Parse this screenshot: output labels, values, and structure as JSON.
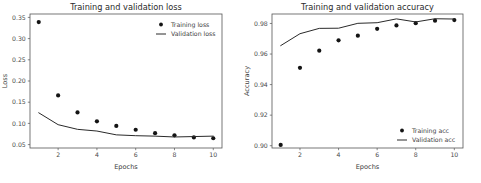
{
  "figure": {
    "background": "#ffffff",
    "accent": "#141414",
    "width": 481,
    "height": 183
  },
  "chart_data": [
    {
      "type": "scatter",
      "id": "loss-chart",
      "title": "Training and validation loss",
      "xlabel": "Epochs",
      "ylabel": "Loss",
      "x": [
        1,
        2,
        3,
        4,
        5,
        6,
        7,
        8,
        9,
        10
      ],
      "xlim": [
        0.55,
        10.45
      ],
      "ylim": [
        0.042,
        0.358
      ],
      "xticks": [
        2,
        4,
        6,
        8,
        10
      ],
      "xticklabels": [
        "2",
        "4",
        "6",
        "8",
        "10"
      ],
      "yticks": [
        0.05,
        0.1,
        0.15,
        0.2,
        0.25,
        0.3,
        0.35
      ],
      "yticklabels": [
        "0.05",
        "0.10",
        "0.15",
        "0.20",
        "0.25",
        "0.30",
        "0.35"
      ],
      "grid": false,
      "legend_position": "upper right",
      "series": [
        {
          "name": "Training loss",
          "style": "dot",
          "color": "#141414",
          "values": [
            0.339,
            0.166,
            0.126,
            0.105,
            0.094,
            0.085,
            0.077,
            0.072,
            0.067,
            0.065
          ]
        },
        {
          "name": "Validation loss",
          "style": "line",
          "color": "#2a2a2a",
          "values": [
            0.125,
            0.097,
            0.086,
            0.082,
            0.073,
            0.071,
            0.07,
            0.068,
            0.069,
            0.07
          ]
        }
      ]
    },
    {
      "type": "scatter",
      "id": "accuracy-chart",
      "title": "Training and validation accuracy",
      "xlabel": "Epochs",
      "ylabel": "Accuracy",
      "x": [
        1,
        2,
        3,
        4,
        5,
        6,
        7,
        8,
        9,
        10
      ],
      "xlim": [
        0.55,
        10.45
      ],
      "ylim": [
        0.8985,
        0.9862
      ],
      "xticks": [
        2,
        4,
        6,
        8,
        10
      ],
      "xticklabels": [
        "2",
        "4",
        "6",
        "8",
        "10"
      ],
      "yticks": [
        0.9,
        0.92,
        0.94,
        0.96,
        0.98
      ],
      "yticklabels": [
        "0.90",
        "0.92",
        "0.94",
        "0.96",
        "0.98"
      ],
      "grid": false,
      "legend_position": "lower right",
      "series": [
        {
          "name": "Training acc",
          "style": "dot",
          "color": "#141414",
          "values": [
            0.9005,
            0.951,
            0.9622,
            0.969,
            0.972,
            0.9765,
            0.9787,
            0.9802,
            0.9818,
            0.9822
          ]
        },
        {
          "name": "Validation acc",
          "style": "line",
          "color": "#2a2a2a",
          "values": [
            0.9655,
            0.9733,
            0.9768,
            0.9769,
            0.9801,
            0.9805,
            0.983,
            0.981,
            0.9831,
            0.9829
          ]
        }
      ]
    }
  ]
}
